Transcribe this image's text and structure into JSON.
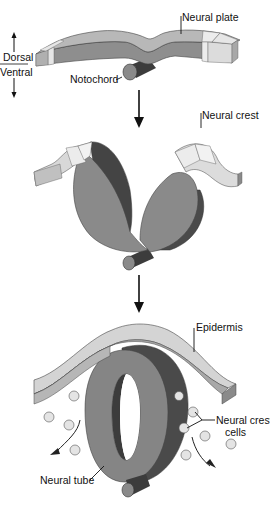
{
  "orientation": {
    "dorsal_label": "Dorsal",
    "ventral_label": "Ventral"
  },
  "stages": [
    {
      "name": "neural-plate-stage",
      "labels": {
        "neural_plate": "Neural plate",
        "notochord": "Notochord"
      }
    },
    {
      "name": "neural-fold-stage",
      "labels": {
        "neural_crest": "Neural crest"
      }
    },
    {
      "name": "neural-tube-stage",
      "labels": {
        "epidermis": "Epidermis",
        "neural_crest_cells_line1": "Neural crest",
        "neural_crest_cells_line2": "cells",
        "neural_tube": "Neural tube"
      }
    }
  ],
  "colors": {
    "background": "#ffffff",
    "neural_plate_top": "#b8b8b8",
    "neural_plate_front": "#8e8e8e",
    "dark_side": "#4a4a4a",
    "light_tissue": "#e2e2e2",
    "epidermis_top": "#d6d6d6",
    "cell_fill": "#e4e4e4",
    "ink": "#111111"
  }
}
